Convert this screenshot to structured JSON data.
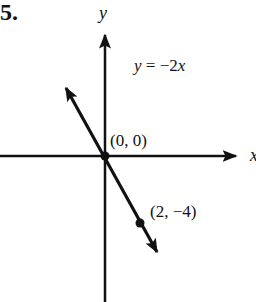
{
  "problem_number": "5.",
  "chart_data": {
    "type": "line",
    "title": "",
    "equation": "y = −2x",
    "xlabel": "x",
    "ylabel": "y",
    "grid": false,
    "legend": "none",
    "series": [
      {
        "name": "y = -2x",
        "slope": -2,
        "intercept": 0,
        "x": [
          0,
          2
        ],
        "y": [
          0,
          -4
        ]
      }
    ],
    "points": [
      {
        "label": "(0, 0)",
        "x": 0,
        "y": 0
      },
      {
        "label": "(2, −4)",
        "x": 2,
        "y": -4
      }
    ],
    "annotations": [
      "y = −2x",
      "(0, 0)",
      "(2, −4)"
    ],
    "colors": {
      "ink": "#111111",
      "background": "#ffffff"
    }
  },
  "labels": {
    "x_axis": "x",
    "y_axis": "y",
    "equation": "y = −2x",
    "origin": "(0, 0)",
    "point": "(2, −4)"
  }
}
